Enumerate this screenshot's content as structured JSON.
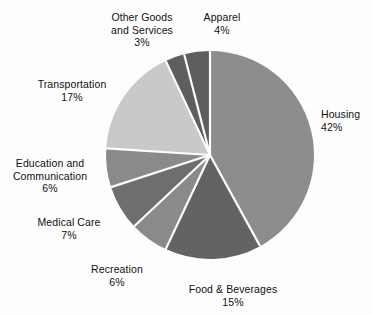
{
  "chart_data": {
    "type": "pie",
    "title": "",
    "subtitle": "",
    "xlabel": "",
    "ylabel": "",
    "legend_position": "none",
    "grid": false,
    "value_unit": "percent",
    "start_angle_deg": -90,
    "direction": "clockwise",
    "categories": [
      "Housing",
      "Food & Beverages",
      "Recreation",
      "Medical Care",
      "Education and Communication",
      "Transportation",
      "Other Goods and Services",
      "Apparel"
    ],
    "values": [
      42,
      15,
      6,
      7,
      6,
      17,
      3,
      4
    ],
    "slices": [
      {
        "name": "Housing",
        "label_lines": [
          "Housing"
        ],
        "value": 42,
        "percent_text": "42%",
        "color": "#8d8d8d",
        "start_deg": -90,
        "sweep_deg": 151.2
      },
      {
        "name": "Food & Beverages",
        "label_lines": [
          "Food & Beverages"
        ],
        "value": 15,
        "percent_text": "15%",
        "color": "#636363",
        "start_deg": 61.2,
        "sweep_deg": 54
      },
      {
        "name": "Recreation",
        "label_lines": [
          "Recreation"
        ],
        "value": 6,
        "percent_text": "6%",
        "color": "#8a8a8a",
        "start_deg": 115.2,
        "sweep_deg": 21.6
      },
      {
        "name": "Medical Care",
        "label_lines": [
          "Medical Care"
        ],
        "value": 7,
        "percent_text": "7%",
        "color": "#6e6e6e",
        "start_deg": 136.8,
        "sweep_deg": 25.2
      },
      {
        "name": "Education and Communication",
        "label_lines": [
          "Education and",
          "Communication"
        ],
        "value": 6,
        "percent_text": "6%",
        "color": "#8a8a8a",
        "start_deg": 162,
        "sweep_deg": 21.6
      },
      {
        "name": "Transportation",
        "label_lines": [
          "Transportation"
        ],
        "value": 17,
        "percent_text": "17%",
        "color": "#c9c9c9",
        "start_deg": 183.6,
        "sweep_deg": 61.2
      },
      {
        "name": "Other Goods and Services",
        "label_lines": [
          "Other Goods",
          "and Services"
        ],
        "value": 3,
        "percent_text": "3%",
        "color": "#5e5e5e",
        "start_deg": 244.8,
        "sweep_deg": 10.8
      },
      {
        "name": "Apparel",
        "label_lines": [
          "Apparel"
        ],
        "value": 4,
        "percent_text": "4%",
        "color": "#5e5e5e",
        "start_deg": 255.6,
        "sweep_deg": 14.4
      }
    ]
  },
  "geometry": {
    "center_x": 210,
    "center_y": 155,
    "radius": 104,
    "separator_color": "#fdfdfd",
    "separator_width": 2.2
  },
  "labels": {
    "housing": {
      "name": "Housing",
      "percent": "42%"
    },
    "food": {
      "name": "Food & Beverages",
      "percent": "15%"
    },
    "recreation": {
      "name": "Recreation",
      "percent": "6%"
    },
    "medical": {
      "name": "Medical Care",
      "percent": "7%"
    },
    "education_l1": {
      "text": "Education and"
    },
    "education_l2": {
      "text": "Communication"
    },
    "education_pct": {
      "text": "6%"
    },
    "transportation": {
      "name": "Transportation",
      "percent": "17%"
    },
    "other_l1": {
      "text": "Other Goods"
    },
    "other_l2": {
      "text": "and Services"
    },
    "other_pct": {
      "text": "3%"
    },
    "apparel": {
      "name": "Apparel",
      "percent": "4%"
    }
  },
  "colors": {
    "background": "#fdfdfd",
    "text": "#111111"
  }
}
